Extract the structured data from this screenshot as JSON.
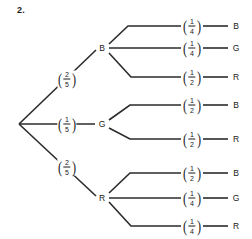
{
  "question": {
    "number": "2."
  },
  "diagram": {
    "type": "probability-tree",
    "root": {
      "label": ""
    },
    "level1": [
      {
        "node": "B",
        "probability": {
          "numerator": "2",
          "denominator": "5"
        }
      },
      {
        "node": "G",
        "probability": {
          "numerator": "1",
          "denominator": "5"
        }
      },
      {
        "node": "R",
        "probability": {
          "numerator": "2",
          "denominator": "5"
        }
      }
    ],
    "level2": [
      {
        "parent": "B",
        "node": "B",
        "probability": {
          "numerator": "1",
          "denominator": "4"
        }
      },
      {
        "parent": "B",
        "node": "G",
        "probability": {
          "numerator": "1",
          "denominator": "4"
        }
      },
      {
        "parent": "B",
        "node": "R",
        "probability": {
          "numerator": "1",
          "denominator": "2"
        }
      },
      {
        "parent": "G",
        "node": "B",
        "probability": {
          "numerator": "1",
          "denominator": "2"
        }
      },
      {
        "parent": "G",
        "node": "R",
        "probability": {
          "numerator": "1",
          "denominator": "2"
        }
      },
      {
        "parent": "R",
        "node": "B",
        "probability": {
          "numerator": "1",
          "denominator": "2"
        }
      },
      {
        "parent": "R",
        "node": "G",
        "probability": {
          "numerator": "1",
          "denominator": "4"
        }
      },
      {
        "parent": "R",
        "node": "R",
        "probability": {
          "numerator": "1",
          "denominator": "4"
        }
      }
    ],
    "colors": {
      "line": "#2b2b2b",
      "text": "#1a1a1a",
      "background": "#ffffff"
    }
  }
}
